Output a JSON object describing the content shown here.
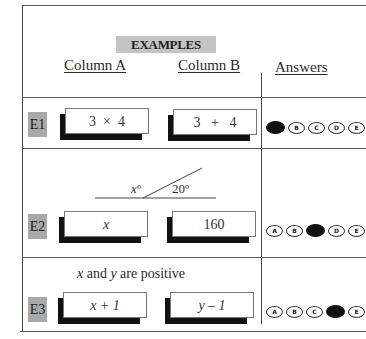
{
  "header": {
    "badge": "EXAMPLES",
    "column_a": "Column A",
    "column_b": "Column B",
    "answers": "Answers"
  },
  "colors": {
    "badge_bg": "#c4c4c4",
    "row_label_bg": "#a9a9a9",
    "filled_bubble": "#111111"
  },
  "rows": [
    {
      "label": "E1",
      "column_a": "3  ×  4",
      "column_b": "3   +   4",
      "bubbles": [
        "A",
        "B",
        "C",
        "D",
        "E"
      ],
      "selected": "A"
    },
    {
      "label": "E2",
      "figure": {
        "angle_left": "xº",
        "angle_right": "20º"
      },
      "column_a": "x",
      "column_b": "160",
      "bubbles": [
        "A",
        "B",
        "C",
        "D",
        "E"
      ],
      "selected": "C"
    },
    {
      "label": "E3",
      "condition": "x and y are positive",
      "column_a": "x + 1",
      "column_b": "y – 1",
      "bubbles": [
        "A",
        "B",
        "C",
        "D",
        "E"
      ],
      "selected": "D"
    }
  ]
}
